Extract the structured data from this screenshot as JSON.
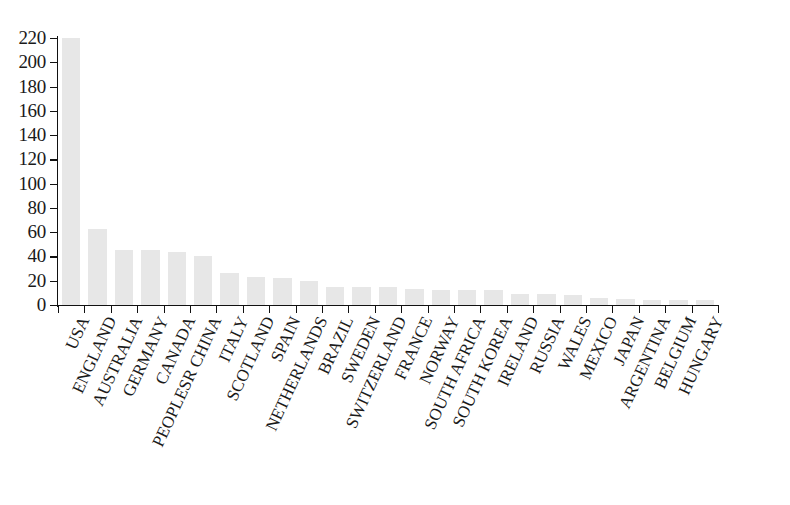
{
  "chart_data": {
    "type": "bar",
    "title": "",
    "subtitle": "",
    "xlabel": "",
    "ylabel": "",
    "ylim": [
      0,
      220
    ],
    "ytick_step": 20,
    "grid": false,
    "legend": null,
    "bar_color": "#e7e7e7",
    "axis_color": "#111111",
    "categories": [
      "USA",
      "ENGLAND",
      "AUSTRALIA",
      "GERMANY",
      "CANADA",
      "PEOPLESR CHINA",
      "ITALY",
      "SCOTLAND",
      "SPAIN",
      "NETHERLANDS",
      "BRAZIL",
      "SWEDEN",
      "SWITZERLAND",
      "FRANCE",
      "NORWAY",
      "SOUTH AFRICA",
      "SOUTH KOREA",
      "IRELAND",
      "RUSSIA",
      "WALES",
      "MEXICO",
      "JAPAN",
      "ARGENTINA",
      "BELGIUM",
      "HUNGARY"
    ],
    "values": [
      220,
      63,
      45,
      45,
      44,
      40,
      26,
      23,
      22,
      20,
      15,
      15,
      15,
      13,
      12,
      12,
      12,
      9,
      9,
      8,
      6,
      5,
      4,
      4,
      4
    ],
    "ytick_labels": [
      "0",
      "20",
      "40",
      "60",
      "80",
      "100",
      "120",
      "140",
      "160",
      "180",
      "200",
      "220"
    ],
    "ytick_values": [
      0,
      20,
      40,
      60,
      80,
      100,
      120,
      140,
      160,
      180,
      200,
      220
    ]
  }
}
